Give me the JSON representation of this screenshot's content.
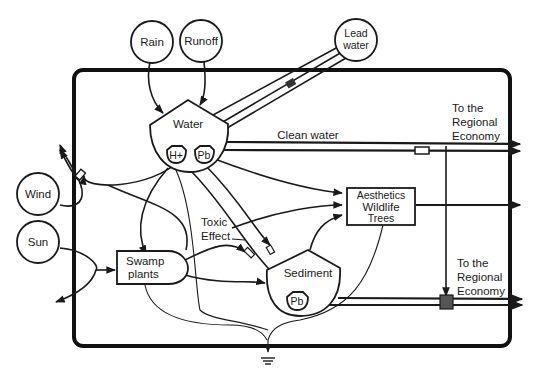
{
  "diagram": {
    "sources": {
      "rain": "Rain",
      "runoff": "Runoff",
      "lead_water": [
        "Lead",
        "water"
      ],
      "wind": "Wind",
      "sun": "Sun"
    },
    "storages": {
      "water": "Water",
      "h_plus": "H+",
      "pb_water": "Pb",
      "sediment": "Sediment",
      "pb_sediment": "Pb"
    },
    "producers": {
      "swamp_plants": [
        "Swamp",
        "plants"
      ]
    },
    "boxes": {
      "amenities": [
        "Aesthetics",
        "Wildlife",
        "Trees"
      ]
    },
    "annotations": {
      "clean_water": "Clean water",
      "toxic_effect": [
        "Toxic",
        "Effect"
      ],
      "regional_economy_top": [
        "To the",
        "Regional",
        "Economy"
      ],
      "regional_economy_bottom": [
        "To the",
        "Regional",
        "Economy"
      ]
    },
    "sink": "heat-sink",
    "colors": {
      "ink": "#1a1a1a",
      "background": "#ffffff"
    }
  }
}
